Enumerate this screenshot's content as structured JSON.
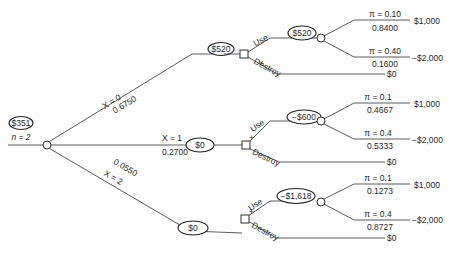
{
  "root": {
    "value": "$351",
    "sample_label": "n = 2"
  },
  "branches": [
    {
      "label": "X = 0",
      "prob": "0.6750",
      "sample_value": "$520",
      "decision": {
        "use_label": "Use",
        "destroy_label": "Destroy",
        "use_value": "$520",
        "outcomes": [
          {
            "pi": "π = 0.10",
            "prob": "0.8400",
            "payoff": "$1,000"
          },
          {
            "pi": "π = 0.40",
            "prob": "0.1600",
            "payoff": "−$2,000"
          }
        ],
        "destroy_payoff": "$0"
      }
    },
    {
      "label": "X = 1",
      "prob": "0.2700",
      "sample_value": "$0",
      "decision": {
        "use_label": "Use",
        "destroy_label": "Destroy",
        "use_value": "−$600",
        "outcomes": [
          {
            "pi": "π = 0.1",
            "prob": "0.4667",
            "payoff": "$1,000"
          },
          {
            "pi": "π = 0.4",
            "prob": "0.5333",
            "payoff": "−$2,000"
          }
        ],
        "destroy_payoff": "$0"
      }
    },
    {
      "label": "X = 2",
      "prob": "0.0550",
      "sample_value": "$0",
      "decision": {
        "use_label": "Use",
        "destroy_label": "Destroy",
        "use_value": "−$1,618",
        "outcomes": [
          {
            "pi": "π = 0.1",
            "prob": "0.1273",
            "payoff": "$1,000"
          },
          {
            "pi": "π = 0.4",
            "prob": "0.8727",
            "payoff": "−$2,000"
          }
        ],
        "destroy_payoff": "$0"
      }
    }
  ]
}
